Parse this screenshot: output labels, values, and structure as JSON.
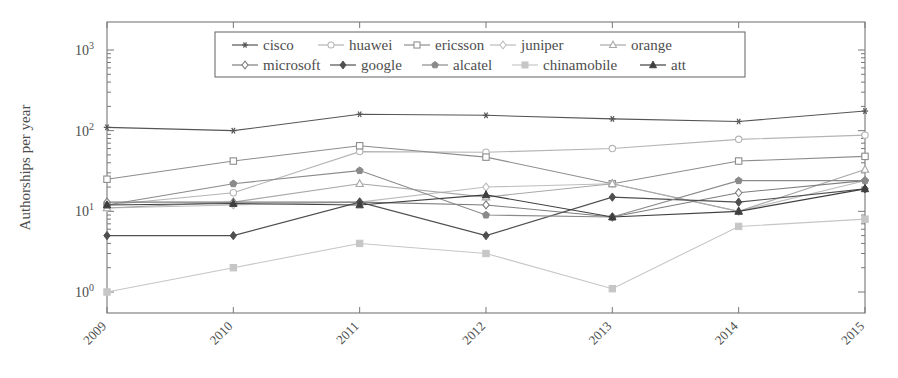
{
  "chart_data": {
    "type": "line",
    "title": "",
    "xlabel": "",
    "ylabel": "Authorships per year",
    "x": [
      2009,
      2010,
      2011,
      2012,
      2013,
      2014,
      2015
    ],
    "xtick_labels": [
      "2009",
      "2010",
      "2011",
      "2012",
      "2013",
      "2014",
      "2015"
    ],
    "yscale": "log",
    "ylim": [
      1,
      1000
    ],
    "ytick_labels": [
      "10^0",
      "10^1",
      "10^2",
      "10^3"
    ],
    "ytick_values": [
      1,
      10,
      100,
      1000
    ],
    "grid": false,
    "legend_position": "top-center",
    "legend_columns": 5,
    "series": [
      {
        "name": "cisco",
        "marker": "asterisk",
        "color": "#555555",
        "values": [
          110,
          100,
          160,
          155,
          140,
          130,
          175
        ]
      },
      {
        "name": "huawei",
        "marker": "open-circle",
        "color": "#b4b4b4",
        "values": [
          12,
          17,
          55,
          54,
          60,
          78,
          88
        ]
      },
      {
        "name": "ericsson",
        "marker": "open-square",
        "color": "#8d8d8d",
        "values": [
          25,
          42,
          65,
          47,
          22,
          42,
          48
        ]
      },
      {
        "name": "juniper",
        "marker": "light-diamond",
        "color": "#bdbdbd",
        "values": [
          11,
          12,
          13,
          20,
          22,
          10,
          24
        ]
      },
      {
        "name": "orange",
        "marker": "open-triangle",
        "color": "#a8a8a8",
        "values": [
          11,
          13,
          22,
          15,
          22,
          10,
          33
        ]
      },
      {
        "name": "microsoft",
        "marker": "open-diamond",
        "color": "#7d7d7d",
        "values": [
          13,
          13,
          13,
          12,
          8.5,
          17,
          24
        ]
      },
      {
        "name": "google",
        "marker": "filled-diamond",
        "color": "#4f4f4f",
        "values": [
          5,
          5,
          13,
          5,
          15,
          13,
          19
        ]
      },
      {
        "name": "alcatel",
        "marker": "filled-pentagon",
        "color": "#8a8a8a",
        "values": [
          12,
          22,
          32,
          9,
          8.5,
          24,
          24
        ]
      },
      {
        "name": "chinamobile",
        "marker": "light-square",
        "color": "#c6c6c6",
        "values": [
          1,
          2,
          4,
          3,
          1.1,
          6.5,
          8
        ]
      },
      {
        "name": "att",
        "marker": "filled-triangle",
        "color": "#3f3f3f",
        "values": [
          12,
          12.5,
          12,
          16,
          8.5,
          10,
          19
        ]
      }
    ]
  }
}
